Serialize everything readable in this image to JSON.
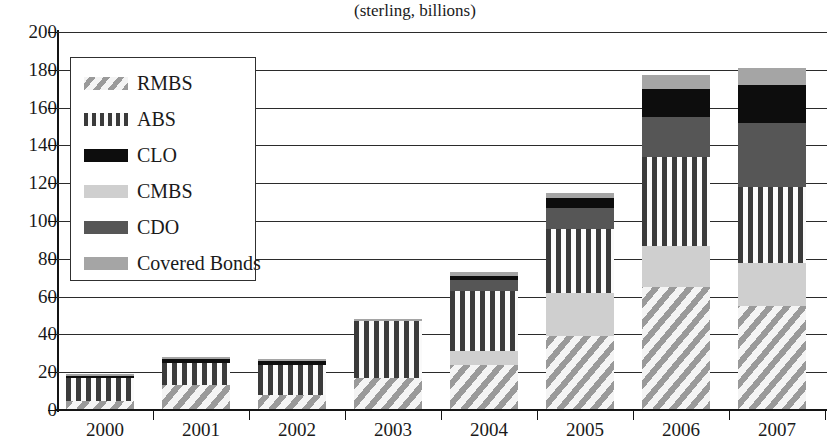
{
  "chart_data": {
    "type": "bar",
    "stacked": true,
    "title": "",
    "subtitle": "(sterling, billions)",
    "xlabel": "",
    "ylabel": "",
    "ylim": [
      0,
      200
    ],
    "ytick_step": 20,
    "yticks": [
      "200",
      "180",
      "160",
      "140",
      "120",
      "100",
      "80",
      "60",
      "40",
      "20",
      "0"
    ],
    "grid": true,
    "legend_position": "upper-left-inside",
    "categories": [
      "2000",
      "2001",
      "2002",
      "2003",
      "2004",
      "2005",
      "2006",
      "2007"
    ],
    "series": [
      {
        "name": "RMBS",
        "pattern": "diagonal-hatch",
        "color": "#9a9a9a",
        "values": [
          5,
          13,
          8,
          17,
          24,
          39,
          65,
          55
        ]
      },
      {
        "name": "CMBS",
        "pattern": "solid-light-gray",
        "color": "#cfcfcf",
        "values": [
          0,
          0,
          0,
          0,
          7,
          23,
          22,
          23
        ]
      },
      {
        "name": "ABS",
        "pattern": "vertical-stripes",
        "color": "#3a3a3a",
        "values": [
          12,
          12,
          16,
          30,
          32,
          34,
          47,
          40
        ]
      },
      {
        "name": "CDO",
        "pattern": "solid-dark-gray",
        "color": "#565656",
        "values": [
          0,
          0,
          0,
          0,
          6,
          11,
          21,
          34
        ]
      },
      {
        "name": "CLO",
        "pattern": "solid-black",
        "color": "#0d0d0d",
        "values": [
          1,
          2,
          2,
          0,
          2,
          5,
          15,
          20
        ]
      },
      {
        "name": "Covered Bonds",
        "pattern": "solid-medium-gray",
        "color": "#a5a5a5",
        "values": [
          1,
          1,
          1,
          1,
          2,
          3,
          7,
          9
        ]
      }
    ],
    "totals": [
      19,
      28,
      27,
      48,
      73,
      115,
      177,
      181
    ]
  },
  "legend": {
    "entries": [
      {
        "label": "RMBS",
        "swatch": "rmbs-swatch"
      },
      {
        "label": "ABS",
        "swatch": "abs-swatch"
      },
      {
        "label": "CLO",
        "swatch": "clo-swatch"
      },
      {
        "label": "CMBS",
        "swatch": "cmbs-swatch"
      },
      {
        "label": "CDO",
        "swatch": "cdo-swatch"
      },
      {
        "label": "Covered Bonds",
        "swatch": "covered-bonds-swatch"
      }
    ]
  },
  "colors": {
    "rmbs": "#9a9a9a",
    "abs": "#3a3a3a",
    "clo": "#0d0d0d",
    "cmbs": "#cfcfcf",
    "cdo": "#565656",
    "covered_bonds": "#a5a5a5",
    "axis": "#141414",
    "grid": "#2b2b2b"
  }
}
